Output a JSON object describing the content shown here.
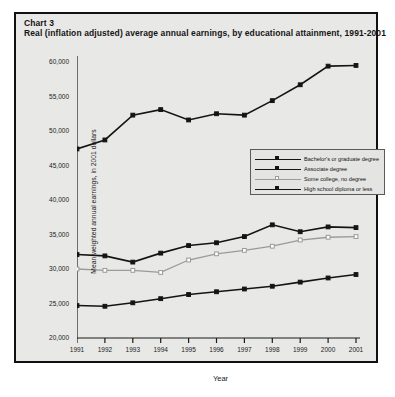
{
  "chart_number": "Chart 3",
  "title": "Real (inflation adjusted) average annual earnings, by educational attainment, 1991-2001",
  "axis": {
    "xlabel": "Year",
    "ylabel": "Mean weighted annual earnings, in 2001 dollars"
  },
  "colors": {
    "background": "#e8e8e6",
    "frame": "#111111",
    "dark_series": "#141414",
    "gray_series": "#9a9a9a"
  },
  "chart_data": {
    "type": "line",
    "title": "Real (inflation adjusted) average annual earnings, by educational attainment, 1991-2001",
    "xlabel": "Year",
    "ylabel": "Mean weighted annual earnings, in 2001 dollars",
    "categories": [
      "1991",
      "1992",
      "1993",
      "1994",
      "1995",
      "1996",
      "1997",
      "1998",
      "1999",
      "2000",
      "2001"
    ],
    "ylim": [
      20000,
      60000
    ],
    "ytick_labels": [
      "20,000",
      "25,000",
      "30,000",
      "35,000",
      "40,000",
      "45,000",
      "50,000",
      "55,000",
      "60,000"
    ],
    "ytick_values": [
      20000,
      25000,
      30000,
      35000,
      40000,
      45000,
      50000,
      55000,
      60000
    ],
    "grid": false,
    "legend_position": "center-right",
    "series": [
      {
        "name": "Bachelor's or graduate degree",
        "marker": "filled-square",
        "color": "#141414",
        "values": [
          47400,
          48700,
          52300,
          53100,
          51600,
          52500,
          52300,
          54400,
          56700,
          59400,
          59500
        ]
      },
      {
        "name": "Associate degree",
        "marker": "filled-square",
        "color": "#141414",
        "values": [
          32100,
          31900,
          31000,
          32300,
          33400,
          33800,
          34700,
          36400,
          35400,
          36100,
          36000
        ]
      },
      {
        "name": "Some college, no degree",
        "marker": "open-square",
        "color": "#9a9a9a",
        "values": [
          30000,
          29800,
          29800,
          29500,
          31300,
          32200,
          32700,
          33300,
          34200,
          34600,
          34700
        ]
      },
      {
        "name": "High school diploma or less",
        "marker": "filled-square",
        "color": "#141414",
        "values": [
          24700,
          24600,
          25100,
          25700,
          26300,
          26700,
          27100,
          27500,
          28100,
          28700,
          29200
        ]
      }
    ]
  }
}
